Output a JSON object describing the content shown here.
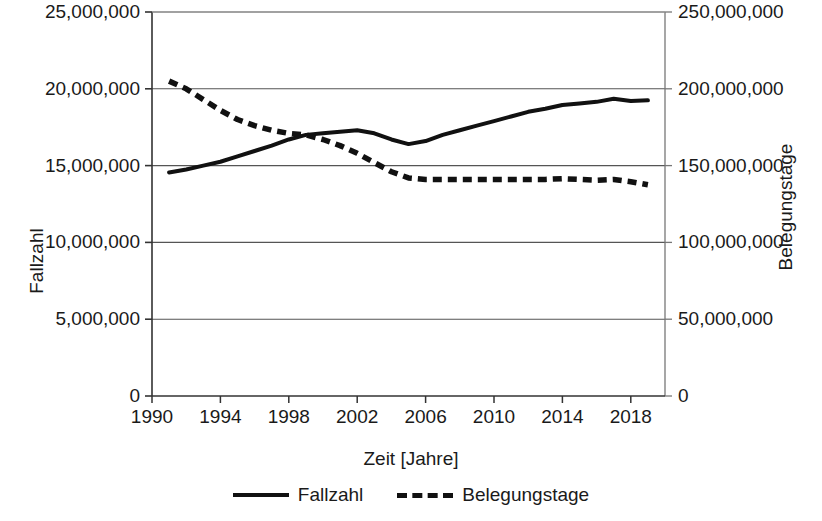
{
  "chart_data": {
    "type": "line",
    "title": "",
    "xlabel": "Zeit [Jahre]",
    "ylabel": "Fallzahl",
    "y2label": "Belegungstage",
    "grid": true,
    "legend_position": "bottom",
    "xlim": [
      1990,
      2020
    ],
    "ylim": [
      0,
      25000000
    ],
    "y2lim": [
      0,
      250000000
    ],
    "x_ticks": [
      "1990",
      "1994",
      "1998",
      "2002",
      "2006",
      "2010",
      "2014",
      "2018"
    ],
    "x_tick_values": [
      1990,
      1994,
      1998,
      2002,
      2006,
      2010,
      2014,
      2018
    ],
    "y_ticks": [
      "0",
      "5,000,000",
      "10,000,000",
      "15,000,000",
      "20,000,000",
      "25,000,000"
    ],
    "y_tick_values": [
      0,
      5000000,
      10000000,
      15000000,
      20000000,
      25000000
    ],
    "y2_ticks": [
      "0",
      "50,000,000",
      "100,000,000",
      "150,000,000",
      "200,000,000",
      "250,000,000"
    ],
    "y2_tick_values": [
      0,
      50000000,
      100000000,
      150000000,
      200000000,
      250000000
    ],
    "x": [
      1991,
      1992,
      1993,
      1994,
      1995,
      1996,
      1997,
      1998,
      1999,
      2000,
      2001,
      2002,
      2003,
      2004,
      2005,
      2006,
      2007,
      2008,
      2009,
      2010,
      2011,
      2012,
      2013,
      2014,
      2015,
      2016,
      2017,
      2018,
      2019
    ],
    "series": [
      {
        "name": "Fallzahl",
        "axis": "left",
        "style": "solid",
        "color": "#111111",
        "values": [
          14550000,
          14750000,
          15000000,
          15250000,
          15600000,
          15950000,
          16300000,
          16700000,
          17000000,
          17100000,
          17200000,
          17300000,
          17100000,
          16700000,
          16400000,
          16600000,
          17000000,
          17300000,
          17600000,
          17900000,
          18200000,
          18500000,
          18700000,
          18950000,
          19050000,
          19150000,
          19350000,
          19200000,
          19250000
        ]
      },
      {
        "name": "Belegungstage",
        "axis": "right",
        "style": "dashed",
        "color": "#111111",
        "values": [
          205000000,
          200000000,
          193000000,
          186000000,
          180000000,
          176000000,
          173000000,
          171000000,
          170000000,
          167000000,
          163000000,
          158000000,
          152000000,
          146000000,
          142000000,
          141000000,
          141000000,
          141000000,
          141000000,
          141000000,
          141000000,
          141000000,
          141000000,
          141500000,
          141000000,
          140500000,
          141000000,
          139500000,
          137500000
        ]
      }
    ]
  },
  "legend": {
    "items": [
      {
        "label": "Fallzahl",
        "style": "solid"
      },
      {
        "label": "Belegungstage",
        "style": "dashed"
      }
    ]
  }
}
